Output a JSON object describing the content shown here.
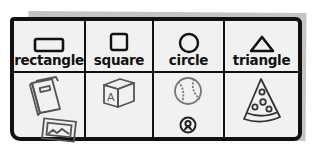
{
  "columns": [
    {
      "label": "rectangle",
      "shape_icon": "rectangle-icon",
      "items": [
        "book-icon",
        "picture-frame-icon"
      ]
    },
    {
      "label": "square",
      "shape_icon": "square-icon",
      "items": [
        "letter-block-icon"
      ]
    },
    {
      "label": "circle",
      "shape_icon": "circle-icon",
      "items": [
        "baseball-icon",
        "button-icon"
      ]
    },
    {
      "label": "triangle",
      "shape_icon": "triangle-icon",
      "items": [
        "pizza-slice-icon"
      ]
    }
  ],
  "letter_block_text": "A",
  "colors": {
    "ink": "#111111",
    "paper": "#f1f1f1",
    "shadow": "#c4c4c4",
    "illustration": "#555555"
  }
}
